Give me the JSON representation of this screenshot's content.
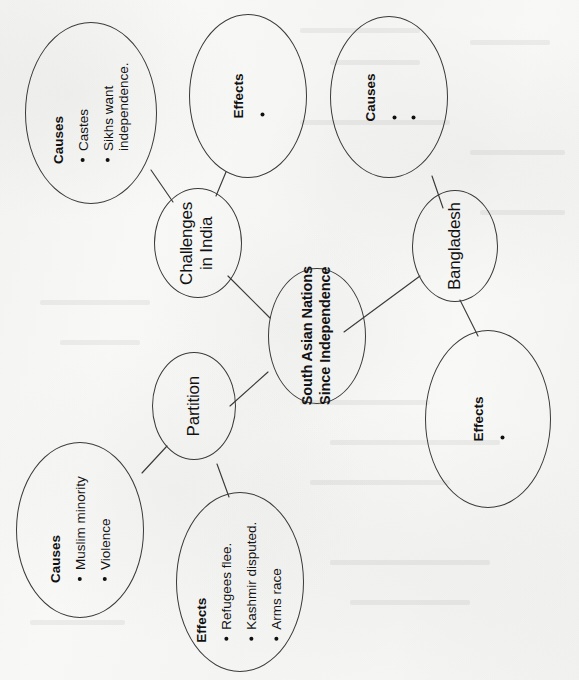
{
  "diagram": {
    "type": "concept-map",
    "orientation": "rotated-90-ccw",
    "paper_color": "#f6f6f5",
    "ink_color": "#121212",
    "center": {
      "id": "center",
      "line1": "South Asian Nations",
      "line2": "Since Independence"
    },
    "branches": [
      {
        "id": "challenges-in-india",
        "line1": "Challenges",
        "line2": "in India"
      },
      {
        "id": "partition",
        "line1": "Partition",
        "line2": ""
      },
      {
        "id": "bangladesh",
        "line1": "Bangladesh",
        "line2": ""
      }
    ],
    "leaves": [
      {
        "id": "india-causes",
        "label": "Causes",
        "bullets": [
          "Castes",
          "Sikhs want\nindependence."
        ]
      },
      {
        "id": "india-effects",
        "label": "Effects",
        "bullets": [
          ""
        ]
      },
      {
        "id": "partition-causes",
        "label": "Causes",
        "bullets": [
          "Muslim minority",
          "Violence"
        ]
      },
      {
        "id": "partition-effects",
        "label": "Effects",
        "bullets": [
          "Refugees flee.",
          "Kashmir disputed.",
          "Arms race"
        ]
      },
      {
        "id": "bangladesh-causes",
        "label": "Causes",
        "bullets": [
          "",
          ""
        ]
      },
      {
        "id": "bangladesh-effects",
        "label": "Effects",
        "bullets": [
          ""
        ]
      }
    ]
  }
}
